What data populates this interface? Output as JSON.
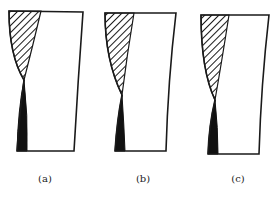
{
  "figure": {
    "panels": [
      {
        "id": "a",
        "label": "(a)",
        "label_pos": {
          "x": 45,
          "y": 173
        },
        "outline": "M9,11 L83,12 Q78,80 74,151 L17,151 Q20,110 24,80 Q9,55 9,11 Z",
        "hatch": "M9,11 L41,11 Q33,45 24,80 Q9,55 9,11 Z",
        "solid": "M24,80 Q28,115 27,151 L17,151 Q18,110 24,80 Z"
      },
      {
        "id": "b",
        "label": "(b)",
        "label_pos": {
          "x": 143,
          "y": 173
        },
        "outline": "M105,13 L176,13 Q168,80 166,151 L115,151 Q117,120 122,95 Q105,60 105,13 Z",
        "hatch": "M105,13 L134,13 Q127,55 122,95 Q105,60 105,13 Z",
        "solid": "M122,95 Q124,125 125,151 L115,151 Q117,120 122,95 Z"
      },
      {
        "id": "c",
        "label": "(c)",
        "label_pos": {
          "x": 238,
          "y": 173
        },
        "outline": "M201,15 L269,15 Q261,85 259,154 L208,154 Q209,125 215,100 Q201,70 201,15 Z",
        "hatch": "M201,15 L229,15 Q222,60 215,100 Q201,70 201,15 Z",
        "solid": "M215,100 Q218,128 218,154 L208,154 Q209,125 215,100 Z"
      }
    ],
    "colors": {
      "stroke": "#1a1a1a",
      "fill_solid": "#111111",
      "background": "#ffffff"
    }
  }
}
